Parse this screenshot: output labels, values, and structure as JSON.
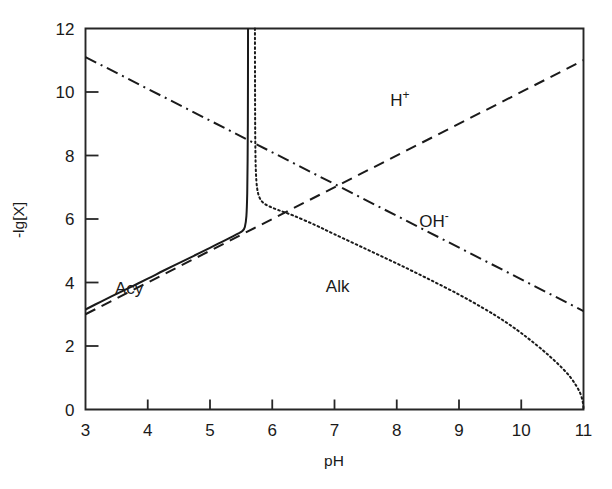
{
  "chart_data": {
    "type": "line",
    "title": "",
    "subtitle": "",
    "xlabel": "pH",
    "ylabel": "-lg[X]",
    "xlim": [
      3,
      11
    ],
    "ylim": [
      0,
      12
    ],
    "xticks": [
      3,
      4,
      5,
      6,
      7,
      8,
      9,
      10,
      11
    ],
    "yticks": [
      0,
      2,
      4,
      6,
      8,
      10,
      12
    ],
    "xtick_labels": [
      "3",
      "4",
      "5",
      "6",
      "7",
      "8",
      "9",
      "10",
      "11"
    ],
    "ytick_labels": [
      "0",
      "2",
      "4",
      "6",
      "8",
      "10",
      "12"
    ],
    "grid": false,
    "legend": "inline-annotations",
    "tick_direction": "in",
    "frame": "box",
    "series": [
      {
        "name": "Acy",
        "label": "Acy",
        "style": "solid",
        "color": "#1a1a1a",
        "label_position": {
          "x": 3.7,
          "y": 3.65
        },
        "points": [
          [
            3.0,
            3.15
          ],
          [
            3.25,
            3.4
          ],
          [
            3.5,
            3.64
          ],
          [
            3.75,
            3.88
          ],
          [
            4.0,
            4.12
          ],
          [
            4.25,
            4.37
          ],
          [
            4.5,
            4.61
          ],
          [
            4.75,
            4.85
          ],
          [
            5.0,
            5.09
          ],
          [
            5.2,
            5.29
          ],
          [
            5.35,
            5.44
          ],
          [
            5.45,
            5.54
          ],
          [
            5.52,
            5.62
          ],
          [
            5.56,
            5.75
          ],
          [
            5.585,
            6.1
          ],
          [
            5.598,
            6.8
          ],
          [
            5.604,
            7.8
          ],
          [
            5.608,
            9.0
          ],
          [
            5.61,
            10.4
          ],
          [
            5.611,
            12.0
          ]
        ]
      },
      {
        "name": "Alk",
        "label": "Alk",
        "style": "dotted",
        "color": "#1a1a1a",
        "label_position": {
          "x": 7.05,
          "y": 3.7
        },
        "points": [
          [
            5.722,
            12.0
          ],
          [
            5.723,
            10.6
          ],
          [
            5.725,
            9.2
          ],
          [
            5.729,
            8.2
          ],
          [
            5.737,
            7.5
          ],
          [
            5.755,
            7.0
          ],
          [
            5.79,
            6.7
          ],
          [
            5.85,
            6.52
          ],
          [
            5.95,
            6.4
          ],
          [
            6.1,
            6.28
          ],
          [
            6.35,
            6.1
          ],
          [
            6.7,
            5.8
          ],
          [
            7.0,
            5.52
          ],
          [
            7.5,
            5.06
          ],
          [
            8.0,
            4.6
          ],
          [
            8.5,
            4.12
          ],
          [
            9.0,
            3.62
          ],
          [
            9.4,
            3.18
          ],
          [
            9.7,
            2.82
          ],
          [
            9.95,
            2.48
          ],
          [
            10.15,
            2.18
          ],
          [
            10.35,
            1.86
          ],
          [
            10.5,
            1.6
          ],
          [
            10.65,
            1.32
          ],
          [
            10.78,
            1.04
          ],
          [
            10.88,
            0.76
          ],
          [
            10.95,
            0.5
          ],
          [
            10.99,
            0.22
          ],
          [
            11.0,
            0.0
          ]
        ]
      },
      {
        "name": "H+",
        "label": "H",
        "label_sup": "+",
        "style": "dashed",
        "color": "#1a1a1a",
        "label_position": {
          "x": 8.05,
          "y": 9.55
        },
        "points": [
          [
            3,
            3
          ],
          [
            11,
            11
          ]
        ]
      },
      {
        "name": "OH-",
        "label": "OH",
        "label_sup": "-",
        "style": "dashdot",
        "color": "#1a1a1a",
        "label_position": {
          "x": 8.6,
          "y": 5.75
        },
        "points": [
          [
            3,
            11.1
          ],
          [
            11,
            3.1
          ]
        ]
      }
    ]
  },
  "figure": {
    "background_color": "#ffffff",
    "foreground_color": "#1a1a1a"
  }
}
